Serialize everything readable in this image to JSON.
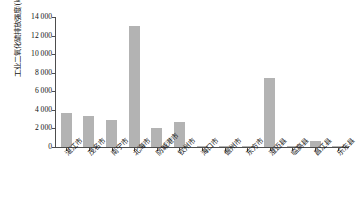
{
  "chart_data": {
    "type": "bar",
    "title": "",
    "xlabel": "",
    "ylabel": "工业二氧化硫排放强度/(kg/km²)",
    "ylabel_text": "工业二氧化硫排放强度/(kg/km",
    "ylabel_sup": "2",
    "ylabel_tail": ")",
    "ylim": [
      0,
      14000
    ],
    "ytick_labels": [
      "14 000",
      "12 000",
      "10 000",
      "8 000",
      "6 000",
      "4 000",
      "2 000",
      "0"
    ],
    "ytick_values": [
      14000,
      12000,
      10000,
      8000,
      6000,
      4000,
      2000,
      0
    ],
    "grid": false,
    "legend": "none",
    "bar_color": "#b3b3b3",
    "axis_color": "#4d4d4d",
    "categories": [
      "湛江市",
      "茂名市",
      "南宁市",
      "北海市",
      "防城港市",
      "钦州市",
      "海口市",
      "儋州市",
      "东方市",
      "澄迈县",
      "临高县",
      "昌江县",
      "乐东县"
    ],
    "values": [
      3700,
      3300,
      2900,
      13000,
      2100,
      2700,
      60,
      40,
      30,
      7400,
      30,
      700,
      20
    ]
  }
}
